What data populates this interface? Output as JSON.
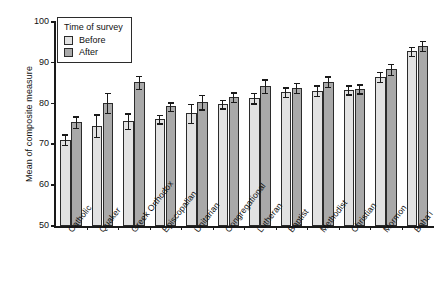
{
  "chart_data": {
    "type": "bar",
    "title": "",
    "subtitle": "",
    "xlabel": "",
    "ylabel": "Mean of composite measure",
    "ylim": [
      50,
      100
    ],
    "yticks": [
      50,
      60,
      70,
      80,
      90,
      100
    ],
    "grid": false,
    "legend_position": "top-left",
    "legend_title": "Time of survey",
    "categories": [
      "Catholic",
      "Quaker",
      "Greek Orthodox",
      "Episcopalian",
      "Unitarian",
      "Congregational",
      "Lutheran",
      "Baptist",
      "Methodist",
      "Christian",
      "Mormon",
      "Baha'i"
    ],
    "series": [
      {
        "name": "Before",
        "color": "#e2e2e2",
        "values": [
          71.2,
          74.6,
          75.7,
          76.2,
          77.6,
          79.9,
          81.4,
          82.8,
          83.2,
          83.4,
          86.6,
          92.8
        ],
        "errors": [
          1.3,
          2.8,
          1.9,
          1.0,
          2.3,
          1.1,
          1.3,
          1.2,
          1.3,
          1.1,
          1.2,
          1.1
        ]
      },
      {
        "name": "After",
        "color": "#a9a9a9",
        "values": [
          75.5,
          80.2,
          85.2,
          79.3,
          80.4,
          81.6,
          84.3,
          83.9,
          85.4,
          83.6,
          88.4,
          94.2
        ],
        "errors": [
          1.4,
          2.4,
          1.6,
          1.0,
          1.8,
          1.2,
          1.7,
          1.2,
          1.3,
          1.1,
          1.4,
          1.2
        ]
      }
    ]
  },
  "legend": {
    "title": "Time of survey",
    "items": [
      {
        "label": "Before",
        "swatch": "before"
      },
      {
        "label": "After",
        "swatch": "after"
      }
    ]
  },
  "axes": {
    "y_title": "Mean of composite measure",
    "y_ticks": [
      "100",
      "90",
      "80",
      "70",
      "60",
      "50"
    ]
  }
}
